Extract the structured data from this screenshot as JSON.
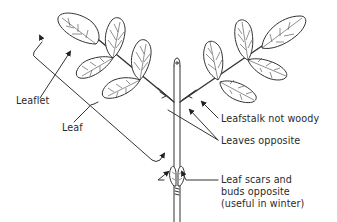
{
  "diagram": {
    "labels": {
      "leaflet": "Leaflet",
      "leaf": "Leaf",
      "leafstalk": "Leafstalk not woody",
      "leaves_opposite": "Leaves opposite",
      "leaf_scars_line1": "Leaf scars and",
      "leaf_scars_line2": "buds opposite",
      "leaf_scars_line3": "(useful in winter)"
    },
    "colors": {
      "ink": "#333333",
      "background": "#ffffff"
    }
  }
}
